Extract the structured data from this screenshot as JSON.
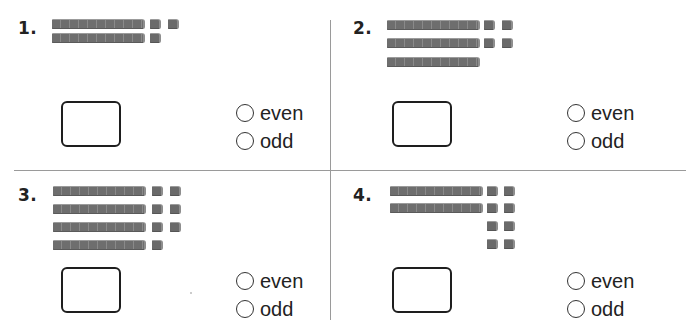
{
  "worksheet": {
    "colors": {
      "divider": "#9a9a9a",
      "block": "#6e6e6e",
      "text": "#222222"
    },
    "problems": [
      {
        "number": "1.",
        "tens": 2,
        "ones": 3,
        "ones_layout": [
          2,
          1
        ],
        "options": [
          "even",
          "odd"
        ],
        "answer_box": ""
      },
      {
        "number": "2.",
        "tens": 3,
        "ones": 4,
        "ones_layout": [
          2,
          2
        ],
        "options": [
          "even",
          "odd"
        ],
        "answer_box": ""
      },
      {
        "number": "3.",
        "tens": 4,
        "ones": 7,
        "ones_layout": [
          2,
          2,
          2,
          1
        ],
        "options": [
          "even",
          "odd"
        ],
        "answer_box": ""
      },
      {
        "number": "4.",
        "tens": 2,
        "ones": 8,
        "ones_layout": [
          2,
          2,
          2,
          2
        ],
        "options": [
          "even",
          "odd"
        ],
        "answer_box": ""
      }
    ]
  }
}
